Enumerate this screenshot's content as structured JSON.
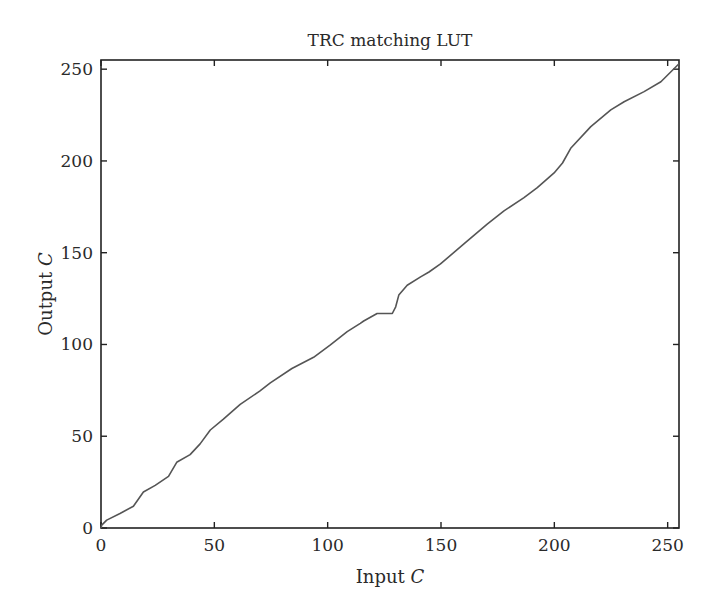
{
  "chart_data": {
    "type": "line",
    "title": "TRC matching LUT",
    "xlabel": "Input C",
    "ylabel": "Output C",
    "xlabel_parts": {
      "text": "Input ",
      "italic": "C"
    },
    "ylabel_parts": {
      "text": "Output ",
      "italic": "C"
    },
    "xlim": [
      0,
      255
    ],
    "ylim": [
      0,
      255
    ],
    "xticks": [
      0,
      50,
      100,
      150,
      200,
      250
    ],
    "yticks": [
      0,
      50,
      100,
      150,
      200,
      250
    ],
    "grid": false,
    "legend": null,
    "line_color": "#555555",
    "series": [
      {
        "name": "TRC matching LUT",
        "x": [
          0,
          0.3,
          2.5,
          8.4,
          14.3,
          18.7,
          23.9,
          29.8,
          33.4,
          39.3,
          43.7,
          48.2,
          54,
          61.4,
          70,
          74.7,
          84.2,
          93.8,
          101.2,
          108.6,
          114.4,
          115.9,
          121.8,
          128.5,
          130,
          131.4,
          135.1,
          141,
          144.7,
          149.8,
          160.1,
          170.4,
          177.8,
          186.6,
          192.5,
          199.9,
          203.6,
          207.2,
          216.1,
          224.9,
          230.8,
          239.6,
          247,
          255
        ],
        "y": [
          0,
          1.6,
          4.3,
          7.9,
          11.9,
          19.6,
          23.2,
          28.1,
          35.8,
          40,
          45.8,
          53.4,
          59.3,
          67.4,
          74.6,
          79.1,
          86.9,
          93,
          99.8,
          107,
          111.5,
          112.8,
          116.9,
          116.9,
          120.5,
          126.9,
          132.3,
          136.8,
          139.5,
          143.9,
          154.8,
          165.6,
          172.8,
          180,
          185.4,
          193.5,
          198.9,
          206.9,
          218.7,
          227.8,
          232.3,
          237.8,
          243.2,
          253
        ]
      }
    ]
  }
}
